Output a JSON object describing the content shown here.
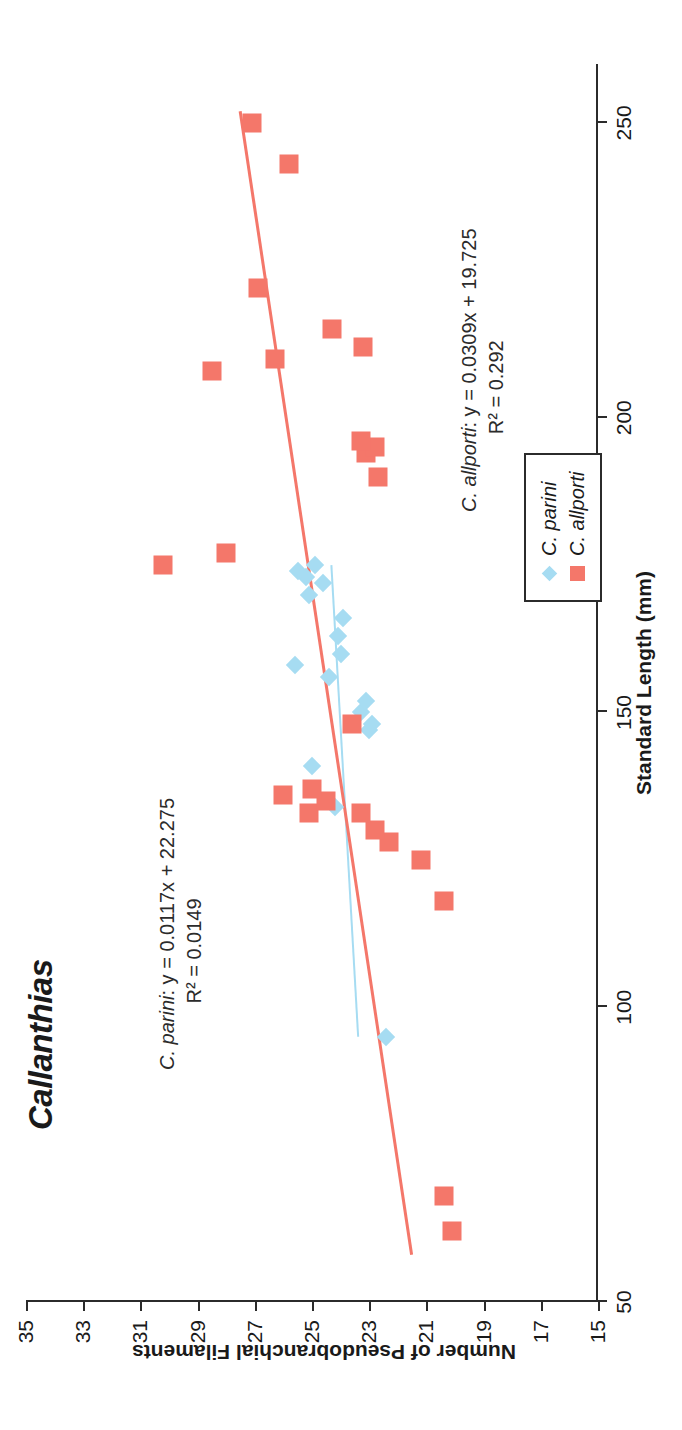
{
  "chart_data": {
    "type": "scatter",
    "title": "Callanthias",
    "xlabel": "Standard Length (mm)",
    "ylabel": "Number of Pseudobranchial Filaments",
    "xlim": [
      50,
      260
    ],
    "ylim": [
      15,
      35
    ],
    "xticks": [
      50,
      100,
      150,
      200,
      250
    ],
    "yticks": [
      15,
      17,
      19,
      21,
      23,
      25,
      27,
      29,
      31,
      33,
      35
    ],
    "grid": false,
    "legend_position": "center-right",
    "series": [
      {
        "name": "C. parini",
        "marker": "diamond",
        "color": "#a6dcf2",
        "points": [
          [
            95,
            22.4
          ],
          [
            134,
            24.2
          ],
          [
            141,
            25.0
          ],
          [
            147,
            23.0
          ],
          [
            148,
            22.9
          ],
          [
            150,
            23.3
          ],
          [
            152,
            23.1
          ],
          [
            156,
            24.4
          ],
          [
            158,
            25.6
          ],
          [
            160,
            24.0
          ],
          [
            163,
            24.1
          ],
          [
            166,
            23.9
          ],
          [
            170,
            25.1
          ],
          [
            172,
            24.6
          ],
          [
            173,
            25.2
          ],
          [
            174,
            25.5
          ],
          [
            175,
            24.9
          ]
        ],
        "trendline": {
          "equation": "y = 0.0117x + 22.275",
          "r2": "R² = 0.0149",
          "slope": 0.0117,
          "intercept": 22.275,
          "x_from": 95,
          "x_to": 175
        }
      },
      {
        "name": "C. allporti",
        "marker": "square",
        "color": "#f4776a",
        "points": [
          [
            62,
            20.1
          ],
          [
            68,
            20.4
          ],
          [
            118,
            20.4
          ],
          [
            125,
            21.2
          ],
          [
            128,
            22.3
          ],
          [
            130,
            22.8
          ],
          [
            133,
            25.1
          ],
          [
            133,
            23.3
          ],
          [
            135,
            24.5
          ],
          [
            136,
            26.0
          ],
          [
            137,
            25.0
          ],
          [
            148,
            23.6
          ],
          [
            175,
            30.2
          ],
          [
            177,
            28.0
          ],
          [
            190,
            22.7
          ],
          [
            194,
            23.1
          ],
          [
            195,
            22.8
          ],
          [
            196,
            23.3
          ],
          [
            208,
            28.5
          ],
          [
            210,
            26.3
          ],
          [
            212,
            23.2
          ],
          [
            215,
            24.3
          ],
          [
            222,
            26.9
          ],
          [
            243,
            25.8
          ],
          [
            250,
            27.1
          ]
        ],
        "trendline": {
          "equation": "y = 0.0309x + 19.725",
          "r2": "R² = 0.292",
          "slope": 0.0309,
          "intercept": 19.725,
          "x_from": 58,
          "x_to": 252
        }
      }
    ],
    "annotations": [
      {
        "id": "allporti",
        "prefix": "C. allporti",
        "text": ": y = 0.0309x + 19.725",
        "line2": "R² = 0.292"
      },
      {
        "id": "parini",
        "prefix": "C. parini",
        "text": ": y = 0.0117x + 22.275",
        "line2": "R² = 0.0149"
      }
    ]
  },
  "legend": {
    "items": [
      {
        "label": "C. parini",
        "marker": "diamond",
        "color": "#a6dcf2"
      },
      {
        "label": "C. allporti",
        "marker": "square",
        "color": "#f4776a"
      }
    ]
  }
}
